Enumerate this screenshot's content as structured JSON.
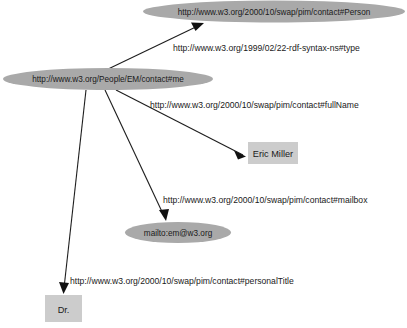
{
  "diagram": {
    "type": "directed-graph",
    "background_color": "#ffffff",
    "resource_node_color": "#a9a9a9",
    "literal_node_color": "#cccccc",
    "edge_color": "#1d1d1d",
    "text_color": "#1a1a1a"
  },
  "nodes": {
    "subject": {
      "label": "http://www.w3.org/People/EM/contact#me",
      "shape": "ellipse",
      "kind": "resource"
    },
    "person_class": {
      "label": "http://www.w3.org/2000/10/swap/pim/contact#Person",
      "shape": "ellipse",
      "kind": "resource"
    },
    "mailbox_value": {
      "label": "mailto:em@w3.org",
      "shape": "ellipse",
      "kind": "resource"
    },
    "fullname_value": {
      "label": "Eric Miller",
      "shape": "rectangle",
      "kind": "literal"
    },
    "title_value": {
      "label": "Dr.",
      "shape": "rectangle",
      "kind": "literal"
    }
  },
  "edges": {
    "type_edge": {
      "label": "http://www.w3.org/1999/02/22-rdf-syntax-ns#type",
      "from": "subject",
      "to": "person_class"
    },
    "fullname_edge": {
      "label": "http://www.w3.org/2000/10/swap/pim/contact#fullName",
      "from": "subject",
      "to": "fullname_value"
    },
    "mailbox_edge": {
      "label": "http://www.w3.org/2000/10/swap/pim/contact#mailbox",
      "from": "subject",
      "to": "mailbox_value"
    },
    "personaltitle_edge": {
      "label": "http://www.w3.org/2000/10/swap/pim/contact#personalTitle",
      "from": "subject",
      "to": "title_value"
    }
  }
}
